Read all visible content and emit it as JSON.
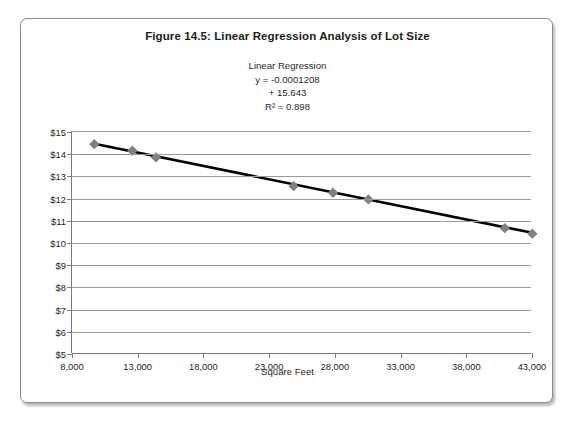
{
  "figure": {
    "title": "Figure 14.5: Linear Regression Analysis of Lot Size",
    "x_axis_title": "Square Feet",
    "annotation": {
      "heading": "Linear Regression",
      "slope_line": "y = -0.0001208",
      "intercept_line": "+ 15.643",
      "r_squared_line": "R² = 0.898"
    }
  },
  "colors": {
    "marker": "#808080",
    "trendline": "#000000",
    "gridline": "#9a9a9a",
    "axis": "#7a7a7a",
    "frame_border": "#8c8c8c",
    "text": "#1e1e1e",
    "background": "#ffffff"
  },
  "chart_data": {
    "type": "scatter",
    "title": "Figure 14.5: Linear Regression Analysis of Lot Size",
    "subtitle": "Linear Regression",
    "xlabel": "Square Feet",
    "ylabel": "",
    "xlim": [
      8000,
      43000
    ],
    "ylim": [
      5,
      15
    ],
    "xticks": [
      8000,
      13000,
      18000,
      23000,
      28000,
      33000,
      38000,
      43000
    ],
    "xtick_labels": [
      "8,000",
      "13,000",
      "18,000",
      "23,000",
      "28,000",
      "33,000",
      "38,000",
      "43,000"
    ],
    "yticks": [
      5,
      6,
      7,
      8,
      9,
      10,
      11,
      12,
      13,
      14,
      15
    ],
    "ytick_labels": [
      "$5",
      "$6",
      "$7",
      "$8",
      "$9",
      "$10",
      "$11",
      "$12",
      "$13",
      "$14",
      "$15"
    ],
    "grid": "horizontal",
    "legend": "none",
    "marker_style": "diamond",
    "x": [
      9700,
      12600,
      14400,
      24900,
      27900,
      30600,
      41000,
      43100
    ],
    "y": [
      14.45,
      14.15,
      13.85,
      12.55,
      12.25,
      11.95,
      10.65,
      10.4
    ],
    "trendline": {
      "type": "linear",
      "equation": "y = -0.0001208x + 15.643",
      "slope": -0.0001208,
      "intercept": 15.643,
      "r_squared": 0.898,
      "x_start": 9700,
      "x_end": 43100
    },
    "annotations": [
      "Linear Regression",
      "y = -0.0001208",
      "+ 15.643",
      "R² = 0.898"
    ]
  }
}
